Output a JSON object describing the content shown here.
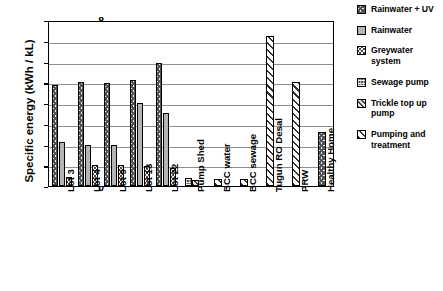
{
  "chart_data": {
    "type": "bar",
    "title": "",
    "xlabel": "",
    "ylabel": "Specific energy (kWh / kL)",
    "ylim": [
      0,
      8
    ],
    "ytick_labels": [
      "8",
      "7",
      "6",
      "5",
      "4",
      "3",
      "2",
      "1",
      "0"
    ],
    "grid": true,
    "legend_position": "right",
    "categories": [
      "Lot 3",
      "Lot 4",
      "Lot 9",
      "Lot 13",
      "Lot 22",
      "Pump Shed",
      "BCC water",
      "BCC sewage",
      "Tugun RO Desal",
      "PRW",
      "Healthy Home"
    ],
    "series": [
      {
        "name": "Rainwater + UV",
        "pattern": "crosshatch",
        "values": [
          4.85,
          5.0,
          4.95,
          5.1,
          5.95,
          null,
          null,
          null,
          null,
          null,
          2.6
        ]
      },
      {
        "name": "Rainwater",
        "pattern": "solid-grey",
        "values": [
          2.1,
          2.0,
          2.0,
          4.0,
          3.5,
          null,
          null,
          null,
          null,
          null,
          null
        ]
      },
      {
        "name": "Greywater system",
        "pattern": "dotted",
        "values": [
          0.45,
          1.0,
          1.0,
          0.95,
          0.85,
          null,
          null,
          null,
          null,
          null,
          null
        ]
      },
      {
        "name": "Sewage pump",
        "pattern": "dark-mesh",
        "values": [
          null,
          null,
          null,
          null,
          null,
          0.4,
          null,
          null,
          null,
          null,
          null
        ]
      },
      {
        "name": "Trickle top up pump",
        "pattern": "dense-diagonal",
        "values": [
          null,
          null,
          null,
          null,
          null,
          0.3,
          null,
          null,
          null,
          null,
          null
        ]
      },
      {
        "name": "Pumping and treatment",
        "pattern": "wide-diagonal",
        "values": [
          null,
          null,
          null,
          null,
          null,
          null,
          0.35,
          0.35,
          7.25,
          5.0,
          null
        ]
      }
    ]
  },
  "axis": {
    "y_title": "Specific energy (kWh / kL)",
    "ticks": [
      "8",
      "7",
      "6",
      "5",
      "4",
      "3",
      "2",
      "1",
      "0"
    ],
    "x_labels": [
      "Lot 3",
      "Lot 4",
      "Lot 9",
      "Lot 13",
      "Lot 22",
      "Pump Shed",
      "BCC water",
      "BCC sewage",
      "Tugun RO Desal",
      "PRW",
      "Healthy Home"
    ]
  },
  "legend": {
    "items": [
      {
        "label": "Rainwater + UV",
        "pattern": "crosshatch"
      },
      {
        "label": "Rainwater",
        "pattern": "solid-grey"
      },
      {
        "label": "Greywater system",
        "pattern": "dotted"
      },
      {
        "label": "Sewage pump",
        "pattern": "dark-mesh"
      },
      {
        "label": "Trickle top up pump",
        "pattern": "dense-diagonal"
      },
      {
        "label": "Pumping and treatment",
        "pattern": "wide-diagonal"
      }
    ]
  },
  "colors": {
    "axis": "#000000",
    "gridline": "#8d8d8d",
    "rainwater_fill": "#b4b4b4",
    "background": "#ffffff"
  }
}
